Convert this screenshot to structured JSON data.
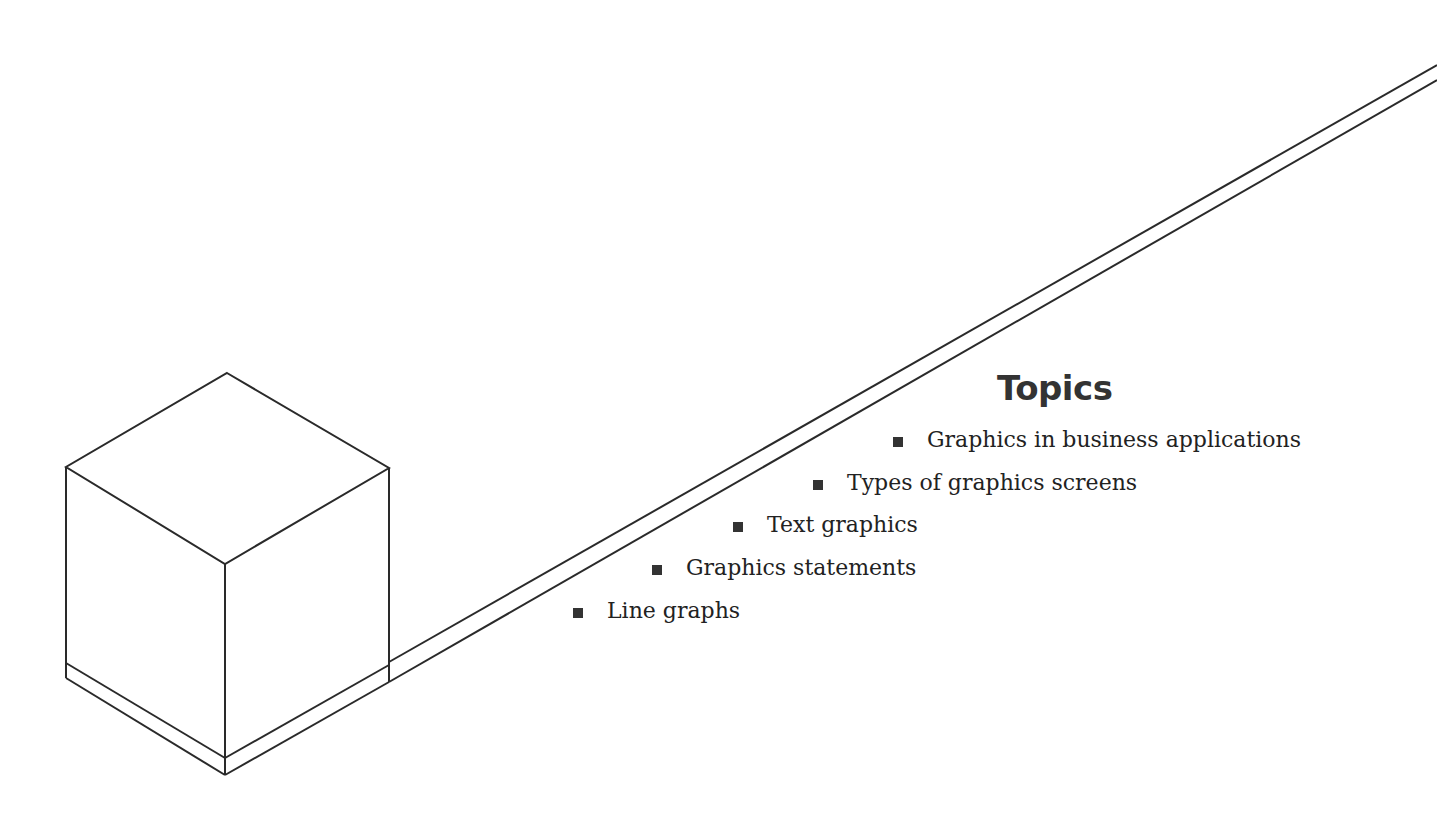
{
  "title": "Topics",
  "topics": [
    {
      "label": "Graphics in business applications"
    },
    {
      "label": "Types of graphics screens"
    },
    {
      "label": "Text graphics"
    },
    {
      "label": "Graphics statements"
    },
    {
      "label": "Line graphs"
    }
  ],
  "colors": {
    "line": "#2a2a2a",
    "text": "#222222",
    "background": "#ffffff"
  }
}
